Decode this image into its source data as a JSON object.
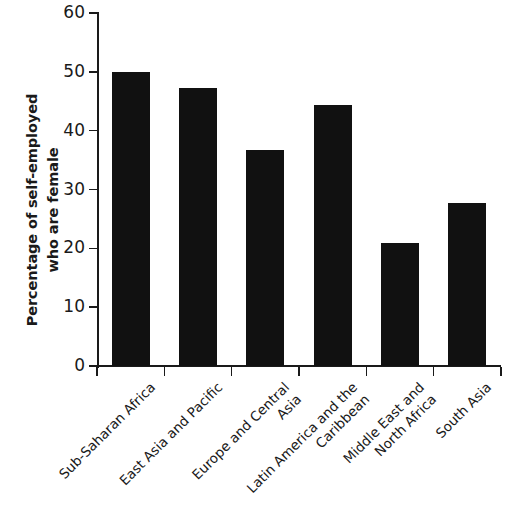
{
  "chart_data": {
    "type": "bar",
    "title": "",
    "subtitle": "",
    "xlabel": "",
    "ylabel": "Percentage of self-employed who are female",
    "ylabel_lines": [
      "Percentage of self-employed",
      "who are female"
    ],
    "categories": [
      "Sub-Saharan Africa",
      "East Asia and Pacific",
      "Europe and Central Asia",
      "Latin America and the Caribbean",
      "Middle East and North Africa",
      "South Asia"
    ],
    "category_lines": [
      [
        "Sub-Saharan Africa"
      ],
      [
        "East Asia and Pacific"
      ],
      [
        "Europe and Central",
        "Asia"
      ],
      [
        "Latin America and the",
        "Caribbean"
      ],
      [
        "Middle East and",
        "North Africa"
      ],
      [
        "South Asia"
      ]
    ],
    "values": [
      50.0,
      47.3,
      36.7,
      44.4,
      20.9,
      27.7
    ],
    "ylim": [
      0,
      60
    ],
    "yticks": [
      0,
      10,
      20,
      30,
      40,
      50,
      60
    ],
    "ytick_labels": [
      "0",
      "10",
      "20",
      "30",
      "40",
      "50",
      "60"
    ],
    "grid": false,
    "legend": false,
    "bar_color": "#111111",
    "axis_color": "#1a1a1a",
    "background_color": "#ffffff"
  }
}
